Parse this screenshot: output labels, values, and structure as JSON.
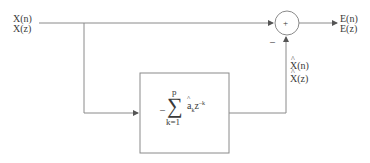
{
  "diagram": {
    "type": "block-diagram",
    "input": {
      "line1": "X(n)",
      "line2": "X(z)"
    },
    "output": {
      "line1": "E(n)",
      "line2": "E(z)"
    },
    "predicted": {
      "line1": "X(n)",
      "line2": "X(z)",
      "hat": true
    },
    "summing_junction": {
      "plus_sign": "+",
      "minus_sign": "–"
    },
    "predictor_block": {
      "neg": "–",
      "sigma": "∑",
      "upper_limit": "p",
      "lower_limit": "k=1",
      "coef": "a",
      "coef_sub": "k",
      "var": "z",
      "exp": "–k"
    },
    "colors": {
      "line": "#8a8a8a",
      "text": "#3a3a3a",
      "background": "#ffffff"
    }
  }
}
